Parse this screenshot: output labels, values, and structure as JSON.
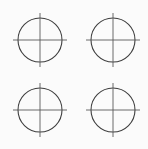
{
  "canvas": {
    "width": 148,
    "height": 149,
    "background_color": "#fbfbfb",
    "title": "Registration Marks"
  },
  "style": {
    "circle_stroke_color": "#3d3d3d",
    "circle_stroke_width": 1.1,
    "crosshair_stroke_color": "#595959",
    "crosshair_stroke_width": 0.9
  },
  "graphic": {
    "type": "registration-mark-grid",
    "rows": 2,
    "columns": 2,
    "count": 4,
    "circle_radius": 22,
    "tick_overhang": 5
  },
  "marks": [
    {
      "id": "mark-top-left",
      "label": "Registration mark 1",
      "cx": 40,
      "cy": 40,
      "r": 22,
      "line_x1": 13,
      "line_x2": 67,
      "line_y1": 13,
      "line_y2": 67
    },
    {
      "id": "mark-top-right",
      "label": "Registration mark 2",
      "cx": 113,
      "cy": 40,
      "r": 22,
      "line_x1": 86,
      "line_x2": 140,
      "line_y1": 13,
      "line_y2": 67
    },
    {
      "id": "mark-bottom-left",
      "label": "Registration mark 3",
      "cx": 40,
      "cy": 110,
      "r": 22,
      "line_x1": 13,
      "line_x2": 67,
      "line_y1": 83,
      "line_y2": 137
    },
    {
      "id": "mark-bottom-right",
      "label": "Registration mark 4",
      "cx": 113,
      "cy": 110,
      "r": 22,
      "line_x1": 86,
      "line_x2": 140,
      "line_y1": 83,
      "line_y2": 137
    }
  ]
}
